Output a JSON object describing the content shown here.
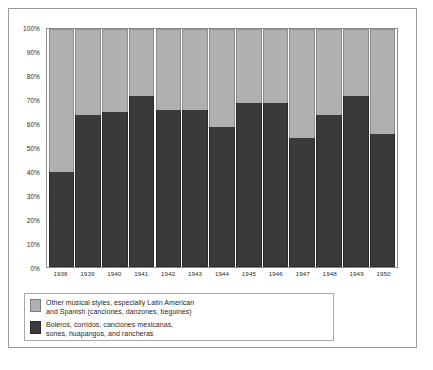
{
  "chart_data": {
    "type": "bar",
    "subtype": "stacked-percent",
    "title": "",
    "xlabel": "",
    "ylabel": "",
    "ylim": [
      0,
      100
    ],
    "grid": false,
    "legend_position": "bottom-left",
    "categories": [
      "1938",
      "1939",
      "1940",
      "1941",
      "1942",
      "1943",
      "1944",
      "1945",
      "1946",
      "1947",
      "1948",
      "1949",
      "1950"
    ],
    "ytick_labels": [
      "100%",
      "90%",
      "80%",
      "70%",
      "60%",
      "50%",
      "40%",
      "30%",
      "20%",
      "10%",
      "0%"
    ],
    "ytick_values": [
      100,
      90,
      80,
      70,
      60,
      50,
      40,
      30,
      20,
      10,
      0
    ],
    "series": [
      {
        "name": "Boleros, corridos, canciones mexicanas, sones, huapangos, and rancheras",
        "color": "#3a3a3a",
        "values": [
          40,
          64,
          65,
          72,
          66,
          66,
          59,
          69,
          69,
          54,
          64,
          72,
          56
        ]
      },
      {
        "name": "Other musical styles, especially Latin American and Spanish (canciones, danzones, beguines)",
        "color": "#b0b0b0",
        "values": [
          60,
          36,
          35,
          28,
          34,
          34,
          41,
          31,
          31,
          46,
          36,
          28,
          44
        ]
      }
    ]
  },
  "legend": {
    "entries": [
      {
        "swatch": "light",
        "line1": "Other musical styles, especially Latin American",
        "line2": "and Spanish (canciones, danzones, beguines)"
      },
      {
        "swatch": "dark",
        "line1": "Boleros, corridos, canciones mexicanas,",
        "line2": "sones, huapangos, and rancheras"
      }
    ]
  }
}
